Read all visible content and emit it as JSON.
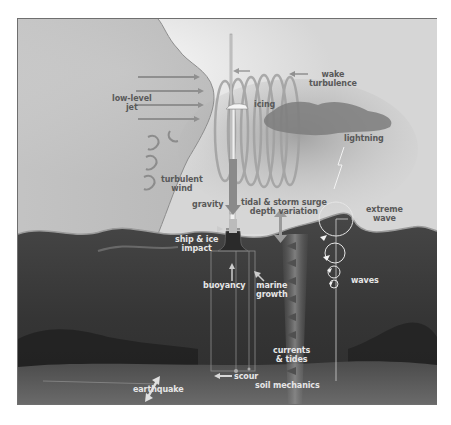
{
  "diagram": {
    "labels": {
      "low_level_jet": "low-level\njet",
      "turbulent_wind": "turbulent\nwind",
      "icing": "icing",
      "wake_turbulence": "wake\nturbulence",
      "lightning": "lightning",
      "gravity": "gravity",
      "tidal_storm_surge": "tidal & storm surge\ndepth variation",
      "ship_ice_impact": "ship & ice\nimpact",
      "extreme_wave": "extreme\nwave",
      "buoyancy": "buoyancy",
      "marine_growth": "marine\ngrowth",
      "waves": "waves",
      "currents_tides": "currents\n& tides",
      "soil_mechanics": "soil mechanics",
      "scour": "scour",
      "earthquake": "earthquake"
    },
    "colors": {
      "sky": "#d9d9d9",
      "sky_highlight": "#f2f2f2",
      "wind_plume": "#b5b5b5",
      "sea": "#3a3a3a",
      "seabed": "#5a5a5a",
      "label_dark": "#595959",
      "label_light": "#e6e6e6",
      "frame_border": "#6f6f6f"
    }
  }
}
